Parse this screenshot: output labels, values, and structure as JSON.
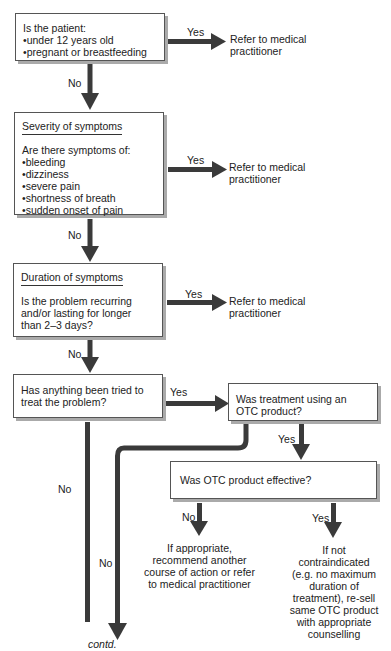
{
  "flowchart": {
    "q1": {
      "title": "Is the patient:",
      "items": [
        "under 12 years old",
        "pregnant or breastfeeding"
      ],
      "yes_label": "Yes",
      "no_label": "No",
      "yes_outcome": "Refer to medical practitioner"
    },
    "q2": {
      "heading": "Severity of symptoms",
      "title": "Are there symptoms of:",
      "items": [
        "bleeding",
        "dizziness",
        "severe pain",
        "shortness of breath",
        "sudden onset of pain"
      ],
      "yes_label": "Yes",
      "no_label": "No",
      "yes_outcome": "Refer to medical practitioner"
    },
    "q3": {
      "heading": "Duration of symptoms",
      "text": "Is the problem recurring and/or lasting for longer than 2–3 days?",
      "yes_label": "Yes",
      "no_label": "No",
      "yes_outcome": "Refer to medical practitioner"
    },
    "q4": {
      "text": "Has anything been tried to treat the problem?",
      "yes_label": "Yes",
      "no_label": "No"
    },
    "q5": {
      "text": "Was treatment using an OTC product?",
      "yes_label": "Yes",
      "no_label": "No"
    },
    "q6": {
      "text": "Was OTC product effective?",
      "no_label": "No",
      "yes_label": "Yes",
      "no_outcome": "If appropriate, recommend another course of action or refer to medical practitioner",
      "yes_outcome": "If not contraindicated (e.g. no maximum duration of treatment), re-sell same OTC product with appropriate counselling"
    },
    "continuation": "contd."
  },
  "colors": {
    "arrow": "#3a3a3a",
    "border": "#555555",
    "shadow": "#aaaaaa"
  }
}
